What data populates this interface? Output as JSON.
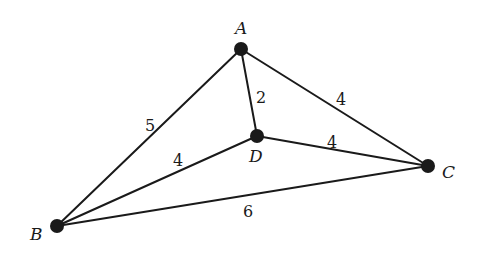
{
  "diagram": {
    "type": "weighted-undirected-graph",
    "nodes": [
      {
        "id": "A",
        "label": "A",
        "x": 241,
        "y": 49,
        "label_x": 235,
        "label_y": 34
      },
      {
        "id": "B",
        "label": "B",
        "x": 57,
        "y": 226,
        "label_x": 30,
        "label_y": 240
      },
      {
        "id": "C",
        "label": "C",
        "x": 428,
        "y": 166,
        "label_x": 442,
        "label_y": 178
      },
      {
        "id": "D",
        "label": "D",
        "x": 257,
        "y": 136,
        "label_x": 249,
        "label_y": 162
      }
    ],
    "edges": [
      {
        "from": "A",
        "to": "B",
        "weight": "5",
        "label_x": 145,
        "label_y": 131
      },
      {
        "from": "A",
        "to": "D",
        "weight": "2",
        "label_x": 256,
        "label_y": 103
      },
      {
        "from": "A",
        "to": "C",
        "weight": "4",
        "label_x": 336,
        "label_y": 105
      },
      {
        "from": "D",
        "to": "B",
        "weight": "4",
        "label_x": 173,
        "label_y": 166
      },
      {
        "from": "D",
        "to": "C",
        "weight": "4",
        "label_x": 327,
        "label_y": 148
      },
      {
        "from": "B",
        "to": "C",
        "weight": "6",
        "label_x": 243,
        "label_y": 217
      }
    ]
  }
}
